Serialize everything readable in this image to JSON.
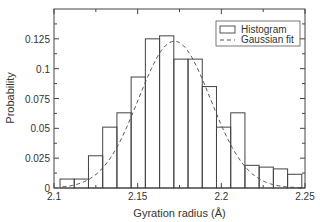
{
  "chart_data": {
    "type": "bar",
    "title": "",
    "xlabel": "Gyration radius (Å)",
    "ylabel": "Probability",
    "xlim": [
      2.1,
      2.25
    ],
    "ylim": [
      0,
      0.15
    ],
    "xticks": [
      2.1,
      2.15,
      2.2,
      2.25
    ],
    "xtick_labels": [
      "2.1",
      "2.15",
      "2.2",
      "2.25"
    ],
    "yticks": [
      0,
      0.025,
      0.05,
      0.075,
      0.1,
      0.125
    ],
    "ytick_labels": [
      "0",
      "0.025",
      "0.05",
      "0.075",
      "0.1",
      "0.125"
    ],
    "grid": false,
    "legend": {
      "position": "upper right",
      "entries": [
        "Histogram",
        "Gaussian fit"
      ]
    },
    "series": [
      {
        "name": "Histogram",
        "style": "hollow-bars",
        "bin_start": 2.1036,
        "bin_width": 0.0085,
        "values": [
          0.0075,
          0.0075,
          0.027,
          0.051,
          0.063,
          0.093,
          0.125,
          0.1275,
          0.108,
          0.108,
          0.085,
          0.051,
          0.063,
          0.019,
          0.0175,
          0.016,
          0.0115
        ]
      },
      {
        "name": "Gaussian fit",
        "style": "dashed-line",
        "mean": 2.172,
        "peak": 0.123,
        "sigma": 0.0215,
        "x_range": [
          2.105,
          2.25
        ]
      }
    ]
  }
}
